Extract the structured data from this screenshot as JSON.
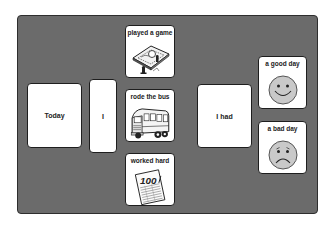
{
  "board": {
    "background_color": "#6b6b6b",
    "cards": {
      "today": {
        "label": "Today"
      },
      "i": {
        "label": "I"
      },
      "played_game": {
        "label": "played a game",
        "icon": "board-game-icon"
      },
      "rode_bus": {
        "label": "rode the bus",
        "icon": "school-bus-icon"
      },
      "worked_hard": {
        "label": "worked hard",
        "icon": "test-paper-100-icon",
        "icon_text": "100"
      },
      "i_had": {
        "label": "I had"
      },
      "good_day": {
        "label": "a good day",
        "icon": "smiley-face-icon"
      },
      "bad_day": {
        "label": "a bad day",
        "icon": "sad-face-icon"
      }
    }
  }
}
